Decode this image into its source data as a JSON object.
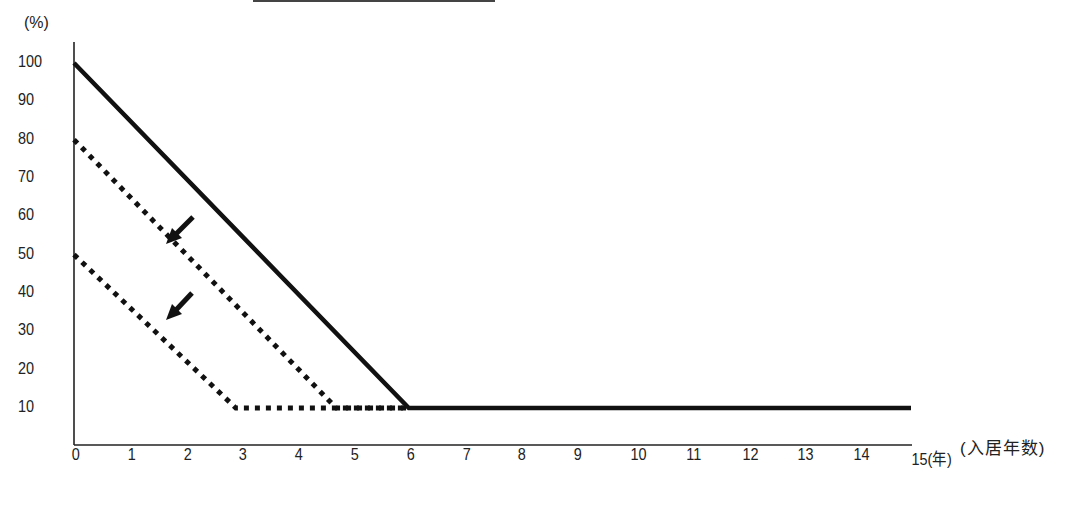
{
  "header": {
    "cropped_underline": true
  },
  "chart_data": {
    "type": "line",
    "title": "",
    "xlabel": "(入居年数)",
    "ylabel": "(%)",
    "x_unit_suffix": "(年)",
    "xlim": [
      0,
      15
    ],
    "ylim": [
      0,
      100
    ],
    "x_ticks": [
      "0",
      "1",
      "2",
      "3",
      "4",
      "5",
      "6",
      "7",
      "8",
      "9",
      "10",
      "11",
      "12",
      "13",
      "14",
      "15"
    ],
    "y_ticks": [
      "100",
      "90",
      "80",
      "70",
      "60",
      "50",
      "40",
      "30",
      "20",
      "10"
    ],
    "grid": false,
    "legend": null,
    "series": [
      {
        "name": "solid",
        "style": "solid",
        "points": [
          [
            0,
            100
          ],
          [
            6,
            10
          ],
          [
            15,
            10
          ]
        ]
      },
      {
        "name": "dotted-80",
        "style": "dotted",
        "points": [
          [
            0,
            80
          ],
          [
            4.7,
            10
          ],
          [
            6,
            10
          ]
        ]
      },
      {
        "name": "dotted-50",
        "style": "dotted",
        "points": [
          [
            0,
            50
          ],
          [
            2.9,
            10
          ],
          [
            6,
            10
          ]
        ]
      }
    ],
    "annotations": [
      {
        "type": "arrow",
        "direction": "down-left",
        "near_series": "dotted-80"
      },
      {
        "type": "arrow",
        "direction": "down-left",
        "near_series": "dotted-50"
      }
    ]
  },
  "labels": {
    "y_unit": "(%)",
    "x_title": "(入居年数)",
    "x_last": "15(年)"
  }
}
